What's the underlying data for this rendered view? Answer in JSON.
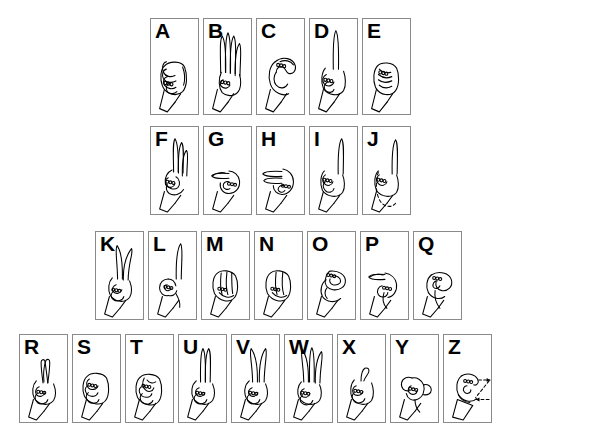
{
  "document": {
    "title": "American Sign Language Manual Alphabet",
    "background_color": "#ffffff",
    "ink_color": "#000000",
    "card_border_color": "#8a8a8a"
  },
  "rows": [
    {
      "id": "row-1",
      "x": 150,
      "y": 18,
      "card_width": 49,
      "card_height": 97,
      "gap": 4,
      "cards": [
        {
          "letter": "A",
          "icon": "asl-hand-a",
          "description": "closed fist, thumb alongside"
        },
        {
          "letter": "B",
          "icon": "asl-hand-b",
          "description": "flat hand, fingers up, thumb across palm"
        },
        {
          "letter": "C",
          "icon": "asl-hand-c",
          "description": "curved hand forming C shape"
        },
        {
          "letter": "D",
          "icon": "asl-hand-d",
          "description": "index finger up, other fingers touch thumb"
        },
        {
          "letter": "E",
          "icon": "asl-hand-e",
          "description": "fingers curled down onto thumb"
        }
      ]
    },
    {
      "id": "row-2",
      "x": 150,
      "y": 126,
      "card_width": 49,
      "card_height": 89,
      "gap": 4,
      "cards": [
        {
          "letter": "F",
          "icon": "asl-hand-f",
          "description": "index and thumb touch, three fingers up"
        },
        {
          "letter": "G",
          "icon": "asl-hand-g",
          "description": "index finger pointing sideways"
        },
        {
          "letter": "H",
          "icon": "asl-hand-h",
          "description": "index and middle finger pointing sideways"
        },
        {
          "letter": "I",
          "icon": "asl-hand-i",
          "description": "pinky finger extended up"
        },
        {
          "letter": "J",
          "icon": "asl-hand-j",
          "description": "pinky extended tracing a J motion"
        }
      ]
    },
    {
      "id": "row-3",
      "x": 95,
      "y": 231,
      "card_width": 49,
      "card_height": 89,
      "gap": 4,
      "cards": [
        {
          "letter": "K",
          "icon": "asl-hand-k",
          "description": "index and middle up in V, thumb between"
        },
        {
          "letter": "L",
          "icon": "asl-hand-l",
          "description": "index up and thumb out forming L"
        },
        {
          "letter": "M",
          "icon": "asl-hand-m",
          "description": "thumb under three fingers"
        },
        {
          "letter": "N",
          "icon": "asl-hand-n",
          "description": "thumb under two fingers"
        },
        {
          "letter": "O",
          "icon": "asl-hand-o",
          "description": "fingers and thumb form an O"
        },
        {
          "letter": "P",
          "icon": "asl-hand-p",
          "description": "K shape pointed downward"
        },
        {
          "letter": "Q",
          "icon": "asl-hand-q",
          "description": "G shape pointed downward"
        }
      ]
    },
    {
      "id": "row-4",
      "x": 19,
      "y": 334,
      "card_width": 49,
      "card_height": 89,
      "gap": 4,
      "cards": [
        {
          "letter": "R",
          "icon": "asl-hand-r",
          "description": "index and middle fingers crossed"
        },
        {
          "letter": "S",
          "icon": "asl-hand-s",
          "description": "fist with thumb across front"
        },
        {
          "letter": "T",
          "icon": "asl-hand-t",
          "description": "thumb between index and middle finger"
        },
        {
          "letter": "U",
          "icon": "asl-hand-u",
          "description": "index and middle fingers up together"
        },
        {
          "letter": "V",
          "icon": "asl-hand-v",
          "description": "index and middle fingers up apart"
        },
        {
          "letter": "W",
          "icon": "asl-hand-w",
          "description": "three fingers up spread"
        },
        {
          "letter": "X",
          "icon": "asl-hand-x",
          "description": "index finger hooked"
        },
        {
          "letter": "Y",
          "icon": "asl-hand-y",
          "description": "thumb and pinky extended"
        },
        {
          "letter": "Z",
          "icon": "asl-hand-z",
          "description": "index finger tracing Z with dashed motion arrows"
        }
      ]
    }
  ]
}
